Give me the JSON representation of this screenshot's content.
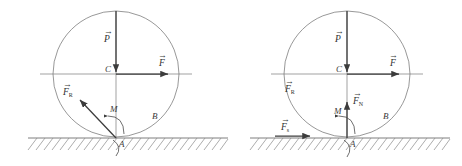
{
  "figure": {
    "panel_count": 2,
    "background_color": "#ffffff",
    "line_color": "#6b6b6b",
    "vector_color": "#3c3c3c",
    "label_color": "#3a3a3a"
  },
  "panels": [
    {
      "id": "left",
      "name": "left-diagram",
      "circle": {
        "cx": 116,
        "cy": 74,
        "r": 63,
        "label_B": "B"
      },
      "ground": {
        "y": 138,
        "x1": 28,
        "x2": 228,
        "hatch_count": 24,
        "hatch_label": "ground-hatching"
      },
      "points": [
        {
          "name": "center",
          "label": "C",
          "x": 116,
          "y": 74
        },
        {
          "name": "contact",
          "label": "A",
          "x": 116,
          "y": 138
        },
        {
          "name": "circle-point",
          "label": "B",
          "x": 158,
          "y": 116
        }
      ],
      "vectors": [
        {
          "name": "weight",
          "label": "P",
          "symbol": "P",
          "subscript": "",
          "direction": "down",
          "from_x": 116,
          "from_y": 11,
          "to_x": 116,
          "to_y": 76,
          "label_x": 105,
          "label_y": 40
        },
        {
          "name": "applied-force",
          "label": "F",
          "symbol": "F",
          "subscript": "",
          "direction": "right",
          "from_x": 116,
          "from_y": 74,
          "to_x": 172,
          "to_y": 74,
          "label_x": 160,
          "label_y": 66
        },
        {
          "name": "resultant-reaction",
          "label": "FR",
          "symbol": "F",
          "subscript": "R",
          "direction": "up-left",
          "from_x": 116,
          "from_y": 138,
          "to_x": 78,
          "to_y": 98,
          "label_x": 68,
          "label_y": 93
        }
      ],
      "moment": {
        "name": "moment-M",
        "label": "M",
        "label_x": 110,
        "label_y": 110,
        "arc_cx": 116,
        "arc_cy": 138
      },
      "axis": {
        "y": 74,
        "x1": 40,
        "x2": 192
      }
    },
    {
      "id": "right",
      "name": "right-diagram",
      "circle": {
        "cx": 347,
        "cy": 74,
        "r": 63,
        "label_B": "B"
      },
      "ground": {
        "y": 138,
        "x1": 250,
        "x2": 450,
        "hatch_count": 24,
        "hatch_label": "ground-hatching"
      },
      "points": [
        {
          "name": "center",
          "label": "C",
          "x": 347,
          "y": 74
        },
        {
          "name": "contact",
          "label": "A",
          "x": 347,
          "y": 138
        },
        {
          "name": "circle-point",
          "label": "B",
          "x": 389,
          "y": 116
        }
      ],
      "vectors": [
        {
          "name": "weight",
          "label": "P",
          "symbol": "P",
          "subscript": "",
          "direction": "down",
          "from_x": 347,
          "from_y": 11,
          "to_x": 347,
          "to_y": 76,
          "label_x": 336,
          "label_y": 40
        },
        {
          "name": "applied-force",
          "label": "F",
          "symbol": "F",
          "subscript": "",
          "direction": "right",
          "from_x": 347,
          "from_y": 74,
          "to_x": 403,
          "to_y": 74,
          "label_x": 391,
          "label_y": 66
        },
        {
          "name": "normal-force",
          "label": "FN",
          "symbol": "F",
          "subscript": "N",
          "direction": "up",
          "from_x": 347,
          "from_y": 138,
          "to_x": 347,
          "to_y": 100,
          "label_x": 353,
          "label_y": 101
        },
        {
          "name": "friction-force",
          "label": "Fs",
          "symbol": "F",
          "subscript": "s",
          "direction": "right",
          "from_x": 275,
          "from_y": 136,
          "to_x": 312,
          "to_y": 136,
          "label_x": 282,
          "label_y": 128
        }
      ],
      "labels_no_vector": [
        {
          "name": "resultant-reaction-label",
          "symbol": "F",
          "subscript": "R",
          "label_x": 289,
          "label_y": 90
        }
      ],
      "moment": {
        "name": "moment-M",
        "label": "M",
        "label_x": 337,
        "label_y": 112,
        "arc_cx": 347,
        "arc_cy": 138
      },
      "axis": {
        "y": 74,
        "x1": 271,
        "x2": 423
      }
    }
  ],
  "symbols": {
    "vector_accent": "→",
    "weight": "P",
    "force": "F",
    "center": "C",
    "contact": "A",
    "rim": "B",
    "moment": "M",
    "sub_R": "R",
    "sub_N": "N",
    "sub_s": "s"
  }
}
